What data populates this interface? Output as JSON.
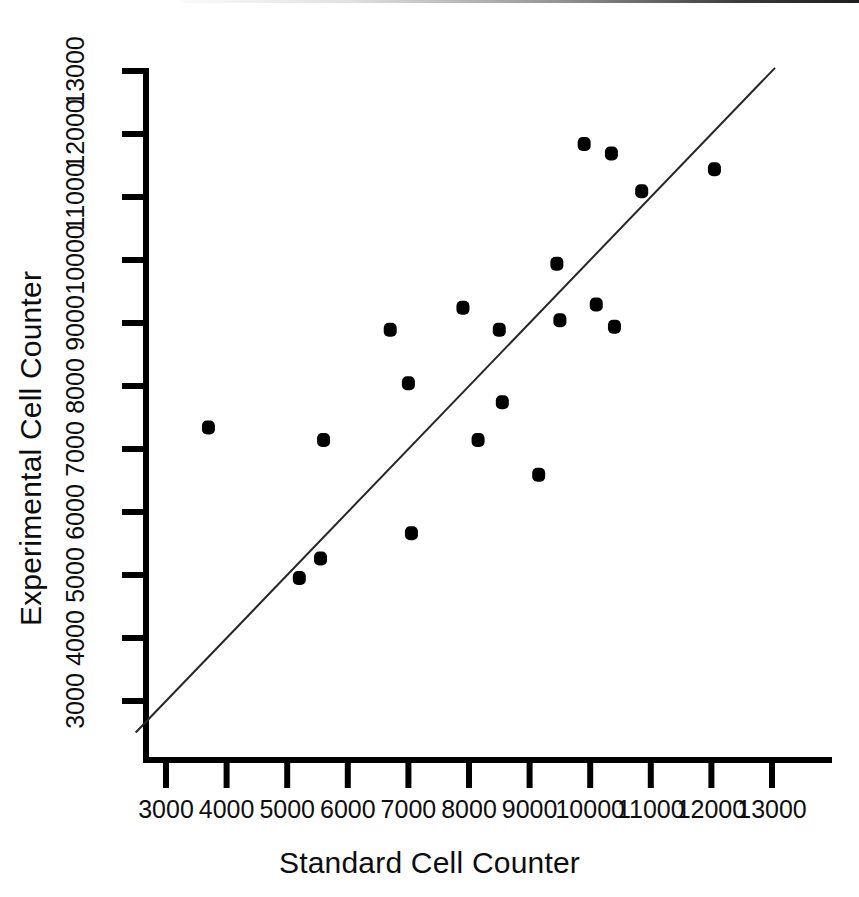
{
  "chart_data": {
    "type": "scatter",
    "title": "",
    "xlabel": "Standard Cell Counter",
    "ylabel": "Experimental Cell Counter",
    "xlim": [
      2500,
      13500
    ],
    "ylim": [
      2500,
      13500
    ],
    "xticks": [
      3000,
      4000,
      5000,
      6000,
      7000,
      8000,
      9000,
      10000,
      11000,
      12000,
      13000
    ],
    "yticks": [
      3000,
      4000,
      5000,
      6000,
      7000,
      8000,
      9000,
      10000,
      11000,
      12000,
      13000
    ],
    "xticklabels": [
      "3000",
      "4000",
      "5000",
      "6000",
      "7000",
      "8000",
      "9000",
      "10000",
      "11000",
      "12000",
      "13000"
    ],
    "yticklabels": [
      "3000",
      "4000",
      "5000",
      "6000",
      "7000",
      "8000",
      "9000",
      "10000",
      "11000",
      "12000",
      "13000"
    ],
    "grid": false,
    "legend": null,
    "marker_color": "#000000",
    "marker_size": 13,
    "series": [
      {
        "name": "Cell counts",
        "points": [
          {
            "x": 3700,
            "y": 7350
          },
          {
            "x": 5200,
            "y": 4960
          },
          {
            "x": 5550,
            "y": 5270
          },
          {
            "x": 5600,
            "y": 7150
          },
          {
            "x": 6700,
            "y": 8900
          },
          {
            "x": 7000,
            "y": 8050
          },
          {
            "x": 7050,
            "y": 5670
          },
          {
            "x": 7900,
            "y": 9250
          },
          {
            "x": 8150,
            "y": 7150
          },
          {
            "x": 8500,
            "y": 8900
          },
          {
            "x": 8550,
            "y": 7750
          },
          {
            "x": 9150,
            "y": 6600
          },
          {
            "x": 9450,
            "y": 9950
          },
          {
            "x": 9500,
            "y": 9050
          },
          {
            "x": 9900,
            "y": 11850
          },
          {
            "x": 10100,
            "y": 9300
          },
          {
            "x": 10350,
            "y": 11700
          },
          {
            "x": 10400,
            "y": 8950
          },
          {
            "x": 10850,
            "y": 11100
          },
          {
            "x": 12050,
            "y": 11450
          }
        ]
      }
    ],
    "reference_line": {
      "name": "identity-line",
      "label": "y = x",
      "from": {
        "x": 2500,
        "y": 2500
      },
      "to": {
        "x": 13050,
        "y": 13050
      },
      "color": "#262626",
      "width": 2
    }
  },
  "axes": {
    "line_color": "#000000",
    "x_axis_title": "Standard Cell Counter",
    "y_axis_title": "Experimental Cell Counter"
  }
}
